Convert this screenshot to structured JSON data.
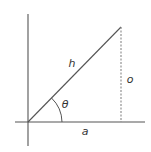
{
  "diagram": {
    "type": "right-triangle-trigonometry",
    "labels": {
      "hypotenuse": "h",
      "opposite": "o",
      "adjacent": "a",
      "angle": "θ"
    },
    "colors": {
      "line": "#555555",
      "dashed": "#888888",
      "text": "#333333",
      "background": "#ffffff"
    }
  }
}
